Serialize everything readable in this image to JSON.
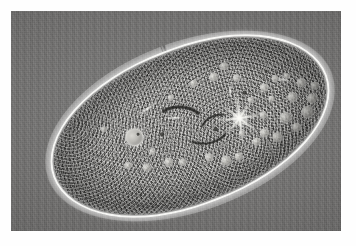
{
  "figure": {
    "kind": "photomicrograph",
    "technique": "phase-contrast light microscopy",
    "orientation_degrees": -20.5,
    "caption": "",
    "border": {
      "style": "white page margin",
      "color": "#ffffff"
    }
  },
  "plate": {
    "label": "microscope-field",
    "background_color": "#6e6e6e",
    "background_description": "uniform gray microscope field with faint vertical scan streaks",
    "x": 11,
    "y": 11,
    "width": 330,
    "height": 220
  },
  "organism": {
    "name": "paramecium-cell",
    "shape": "elongated slipper / cigar shape",
    "body_color": "#7d7c7a",
    "pellicle_color": "#fcfcfa",
    "bounding_box": {
      "x": 33,
      "y": 36,
      "width": 292,
      "height": 158
    },
    "features": [
      {
        "name": "anterior-end",
        "label": "anterior (left) rounded tip"
      },
      {
        "name": "posterior-end",
        "label": "posterior (right) broad tip"
      },
      {
        "name": "pellicle-outline",
        "label": "bright refractile pellicle halo"
      },
      {
        "name": "cilia-fringe",
        "label": "dense cilia along the cell surface"
      },
      {
        "name": "endoplasm",
        "label": "granular endoplasm packed with inclusions"
      },
      {
        "name": "anterior-contractile-vacuole",
        "label": "anterior contractile vacuole"
      },
      {
        "name": "posterior-contractile-vacuole",
        "label": "posterior contractile vacuole with radiating collecting canals"
      },
      {
        "name": "oral-groove",
        "label": "oral groove and cytopharynx"
      },
      {
        "name": "food-vacuoles",
        "label": "food vacuoles"
      },
      {
        "name": "trichocyst-layer",
        "label": "cortical trichocyst layer"
      }
    ],
    "organelle_counts": {
      "contractile_vacuoles": 2,
      "radial_canals": 8,
      "visible_food_vacuoles": 34
    }
  },
  "palette": {
    "page": "#ffffff",
    "field_light": "#777776",
    "field_dark": "#5e5d5c",
    "cytoplasm_light": "#8c8b89",
    "cytoplasm_dark": "#646361",
    "highlight": "#fcfcfa",
    "shadow": "#181816"
  }
}
